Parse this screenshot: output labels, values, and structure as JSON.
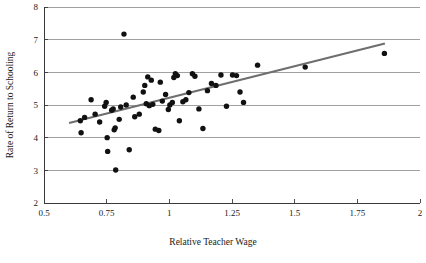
{
  "chart_data": {
    "type": "scatter",
    "title": "",
    "subtitle": "",
    "xlabel": "Relative Teacher Wage",
    "ylabel": "Rate of Return to Schooling",
    "xlim": [
      0.5,
      2
    ],
    "ylim": [
      2,
      8
    ],
    "xticks": [
      0.5,
      0.75,
      1,
      1.25,
      1.5,
      1.75,
      2
    ],
    "xticklabels": [
      "0.5",
      "0.75",
      "1",
      "1.25",
      "1.5",
      "1.75",
      "2"
    ],
    "yticks": [
      2,
      3,
      4,
      5,
      6,
      7,
      8
    ],
    "yticklabels": [
      "2",
      "3",
      "4",
      "5",
      "6",
      "7",
      "8"
    ],
    "grid": "horizontal",
    "legend": "none",
    "marker": "filled-circle",
    "marker_color": "#111111",
    "marker_size_px": 5.4,
    "points": [
      {
        "x": 0.645,
        "y": 4.52
      },
      {
        "x": 0.648,
        "y": 4.15
      },
      {
        "x": 0.662,
        "y": 4.62
      },
      {
        "x": 0.688,
        "y": 5.16
      },
      {
        "x": 0.704,
        "y": 4.72
      },
      {
        "x": 0.722,
        "y": 4.48
      },
      {
        "x": 0.742,
        "y": 4.96
      },
      {
        "x": 0.748,
        "y": 5.08
      },
      {
        "x": 0.752,
        "y": 4.0
      },
      {
        "x": 0.754,
        "y": 3.58
      },
      {
        "x": 0.77,
        "y": 4.84
      },
      {
        "x": 0.776,
        "y": 4.88
      },
      {
        "x": 0.78,
        "y": 4.24
      },
      {
        "x": 0.784,
        "y": 4.3
      },
      {
        "x": 0.786,
        "y": 3.01
      },
      {
        "x": 0.8,
        "y": 4.56
      },
      {
        "x": 0.806,
        "y": 4.94
      },
      {
        "x": 0.819,
        "y": 7.17
      },
      {
        "x": 0.828,
        "y": 5.0
      },
      {
        "x": 0.84,
        "y": 3.63
      },
      {
        "x": 0.856,
        "y": 5.24
      },
      {
        "x": 0.862,
        "y": 4.64
      },
      {
        "x": 0.88,
        "y": 4.72
      },
      {
        "x": 0.896,
        "y": 5.4
      },
      {
        "x": 0.902,
        "y": 5.6
      },
      {
        "x": 0.908,
        "y": 5.04
      },
      {
        "x": 0.914,
        "y": 5.86
      },
      {
        "x": 0.92,
        "y": 4.98
      },
      {
        "x": 0.928,
        "y": 5.76
      },
      {
        "x": 0.934,
        "y": 5.02
      },
      {
        "x": 0.944,
        "y": 4.26
      },
      {
        "x": 0.958,
        "y": 4.22
      },
      {
        "x": 0.964,
        "y": 5.7
      },
      {
        "x": 0.972,
        "y": 5.12
      },
      {
        "x": 0.985,
        "y": 5.32
      },
      {
        "x": 0.996,
        "y": 4.86
      },
      {
        "x": 1.002,
        "y": 5.0
      },
      {
        "x": 1.012,
        "y": 5.08
      },
      {
        "x": 1.018,
        "y": 5.84
      },
      {
        "x": 1.024,
        "y": 5.96
      },
      {
        "x": 1.032,
        "y": 5.9
      },
      {
        "x": 1.04,
        "y": 4.52
      },
      {
        "x": 1.054,
        "y": 5.1
      },
      {
        "x": 1.066,
        "y": 5.16
      },
      {
        "x": 1.078,
        "y": 5.38
      },
      {
        "x": 1.092,
        "y": 5.96
      },
      {
        "x": 1.102,
        "y": 5.88
      },
      {
        "x": 1.118,
        "y": 4.88
      },
      {
        "x": 1.134,
        "y": 4.28
      },
      {
        "x": 1.152,
        "y": 5.44
      },
      {
        "x": 1.168,
        "y": 5.66
      },
      {
        "x": 1.186,
        "y": 5.6
      },
      {
        "x": 1.206,
        "y": 5.92
      },
      {
        "x": 1.228,
        "y": 4.96
      },
      {
        "x": 1.252,
        "y": 5.92
      },
      {
        "x": 1.268,
        "y": 5.9
      },
      {
        "x": 1.282,
        "y": 5.4
      },
      {
        "x": 1.296,
        "y": 5.08
      },
      {
        "x": 1.352,
        "y": 6.22
      },
      {
        "x": 1.542,
        "y": 6.16
      },
      {
        "x": 1.858,
        "y": 6.58
      }
    ],
    "trend_line": {
      "label": "fitted regression line",
      "color": "#6e6e6e",
      "x0": 0.6,
      "y0": 4.45,
      "x1": 1.86,
      "y1": 6.88
    }
  }
}
